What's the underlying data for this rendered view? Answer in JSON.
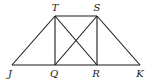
{
  "diagram": {
    "type": "geometry-figure",
    "points": {
      "T": {
        "label": "T",
        "x": 55,
        "y": 16,
        "lx": 55,
        "ly": 11
      },
      "S": {
        "label": "S",
        "x": 97,
        "y": 16,
        "lx": 97,
        "ly": 11
      },
      "J": {
        "label": "J",
        "x": 12,
        "y": 65,
        "lx": 10,
        "ly": 77
      },
      "Q": {
        "label": "Q",
        "x": 55,
        "y": 65,
        "lx": 54,
        "ly": 77
      },
      "R": {
        "label": "R",
        "x": 97,
        "y": 65,
        "lx": 96,
        "ly": 77
      },
      "K": {
        "label": "K",
        "x": 140,
        "y": 65,
        "lx": 140,
        "ly": 77
      }
    },
    "segments": [
      [
        "T",
        "S"
      ],
      [
        "J",
        "K"
      ],
      [
        "J",
        "T"
      ],
      [
        "S",
        "K"
      ],
      [
        "T",
        "Q"
      ],
      [
        "S",
        "R"
      ],
      [
        "T",
        "R"
      ],
      [
        "Q",
        "S"
      ]
    ],
    "labels": [
      "T",
      "S",
      "J",
      "Q",
      "R",
      "K"
    ]
  }
}
